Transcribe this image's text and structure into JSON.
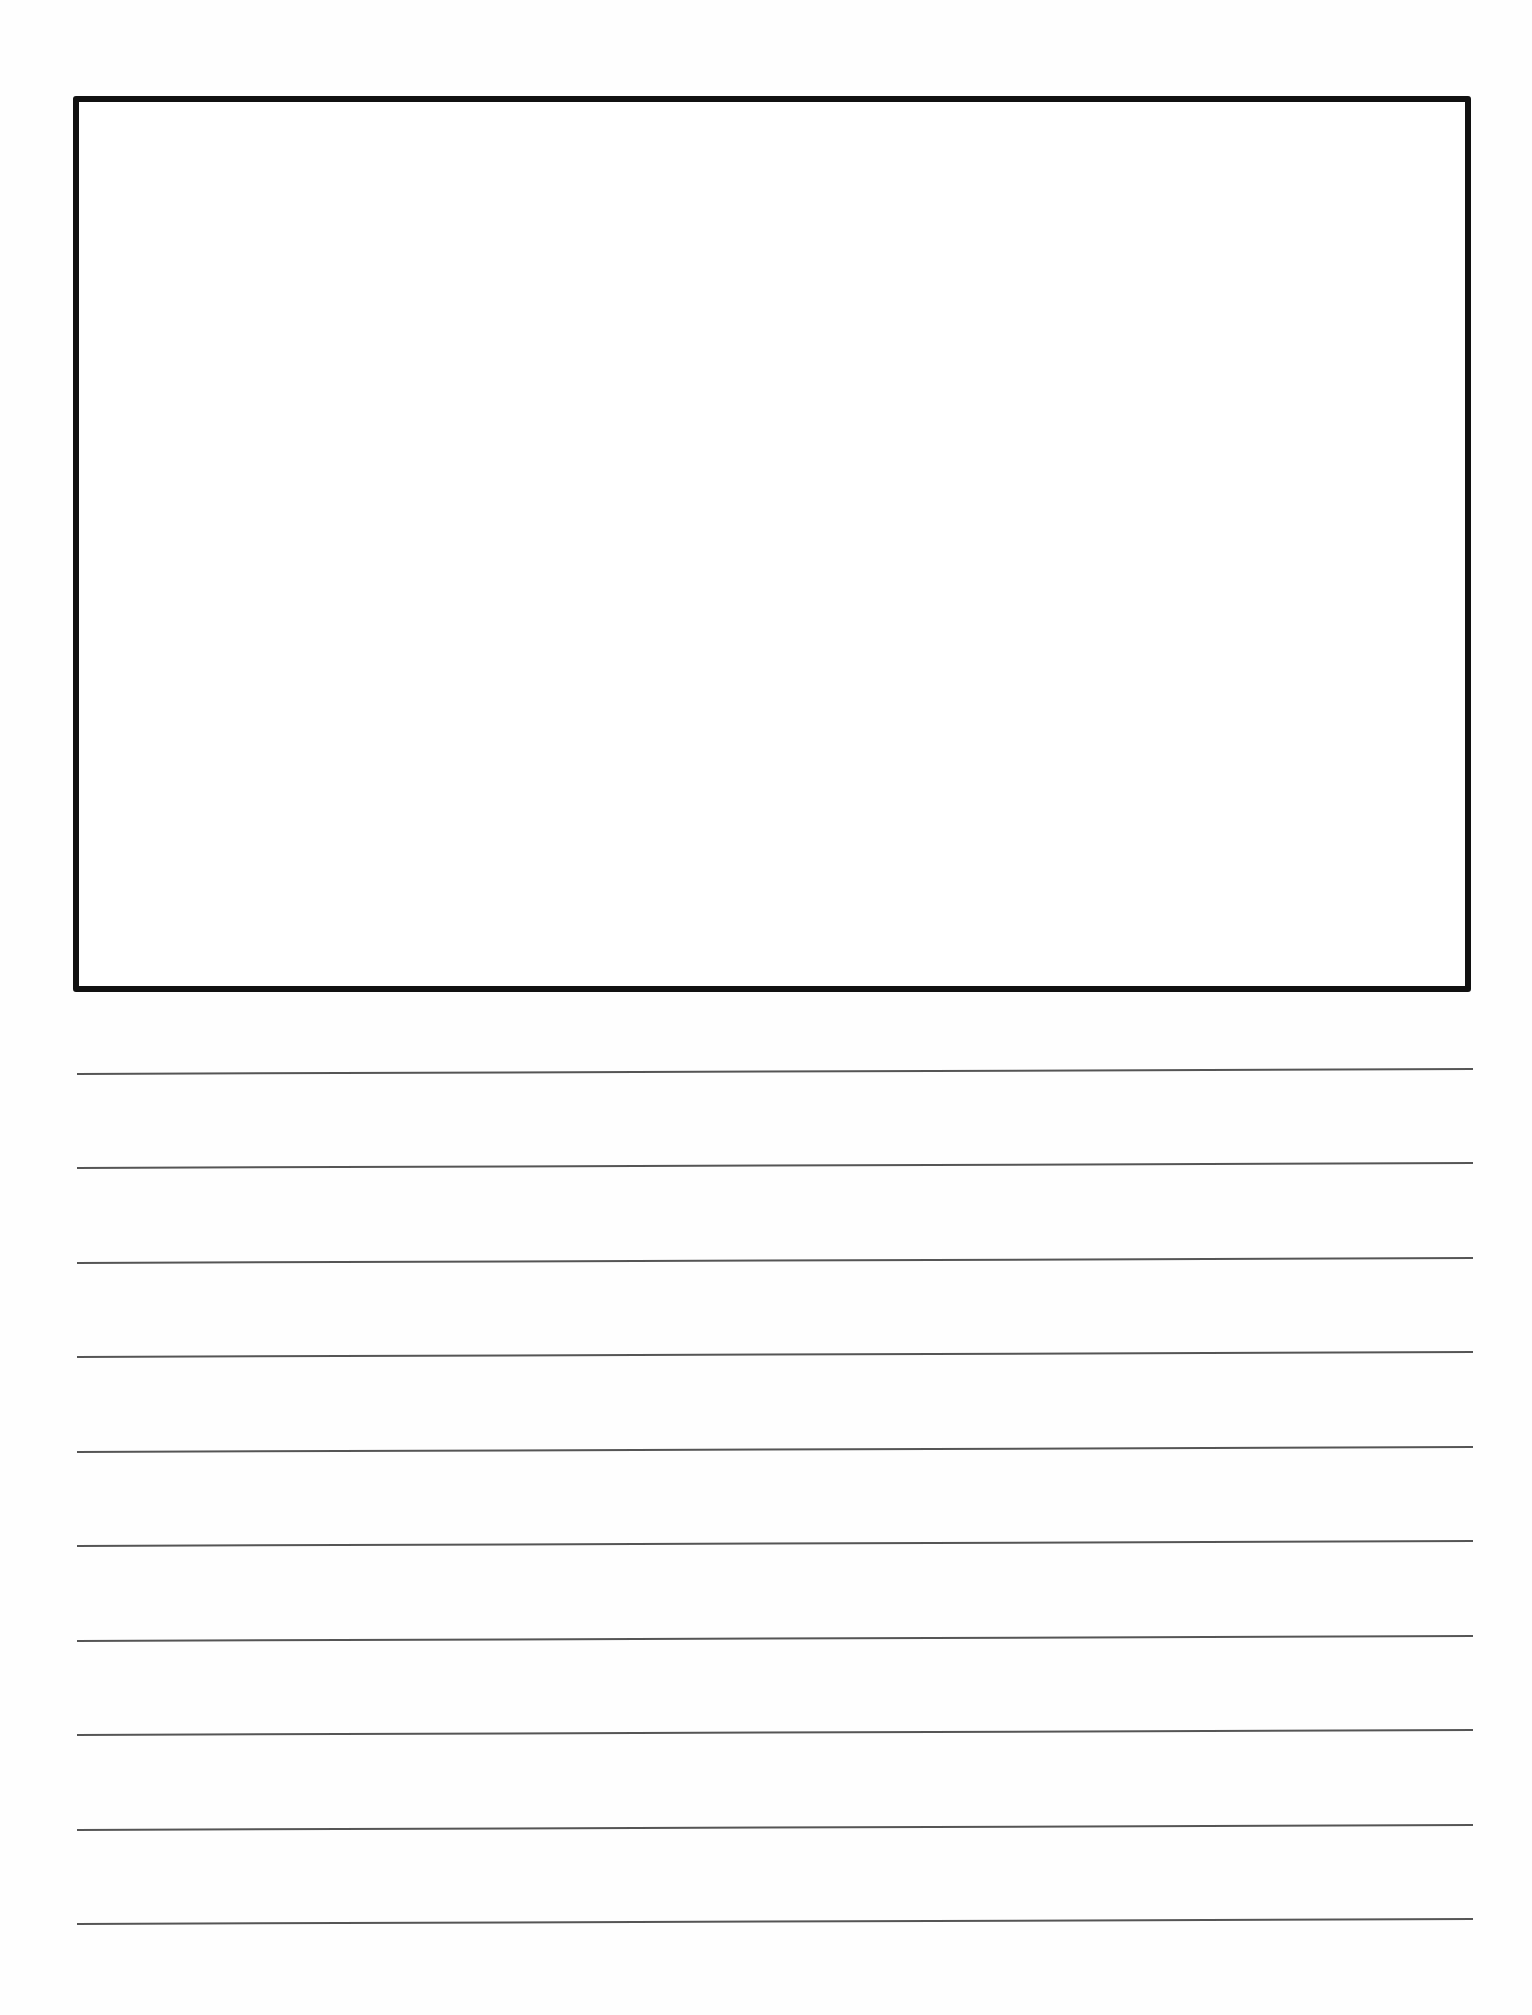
{
  "document": {
    "type": "primary writing paper",
    "drawing_box": {
      "content": ""
    },
    "writing_lines": {
      "count": 10,
      "x_start": 77,
      "x_end": 1473,
      "y_left": [
        1074,
        1168,
        1263,
        1357,
        1452,
        1546,
        1641,
        1735,
        1830,
        1924
      ],
      "slant_px": 5,
      "color": "#555555"
    },
    "colors": {
      "background": "#ffffff",
      "box_border": "#111111"
    }
  }
}
